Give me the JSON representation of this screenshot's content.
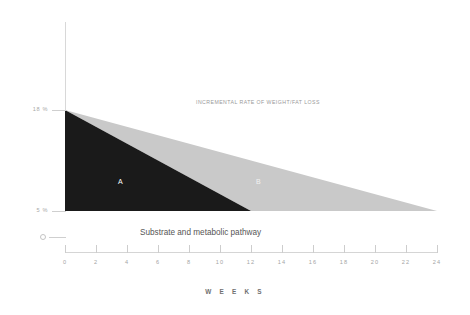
{
  "chart_data": {
    "type": "area",
    "title": "",
    "xlabel": "W E E K S",
    "ylabel": "B O D Y  F A T",
    "xlim": [
      0,
      24
    ],
    "ylim": [
      0,
      18
    ],
    "grid": false,
    "legend_position": "none",
    "x_ticks": [
      0,
      2,
      4,
      6,
      8,
      10,
      12,
      14,
      16,
      18,
      20,
      22,
      24
    ],
    "x_tick_labels": [
      "0",
      "2",
      "4",
      "6",
      "8",
      "10",
      "12",
      "14",
      "16",
      "18",
      "20",
      "22",
      "24"
    ],
    "y_ticks": [
      0,
      5,
      18
    ],
    "y_tick_labels": [
      "0",
      "5 %",
      "18 %"
    ],
    "series": [
      {
        "name": "A",
        "label": "A",
        "color": "#1a1a1a",
        "description": "Dark wedge: body fat falls from 18% at week 0 to 5% at week 12",
        "points": [
          [
            0,
            18
          ],
          [
            0,
            5
          ],
          [
            12,
            5
          ]
        ]
      },
      {
        "name": "B",
        "label": "B",
        "color": "#c9c9c9",
        "description": "Light wedge: body fat falls from 18% at week 0 to 5% at week 24",
        "points": [
          [
            0,
            18
          ],
          [
            12,
            5
          ],
          [
            24,
            5
          ]
        ]
      }
    ],
    "annotations": [
      {
        "id": "incremental-rate",
        "text": "INCREMENTAL RATE OF WEIGHT/FAT LOSS",
        "x": 8.6,
        "y": 17.2
      },
      {
        "id": "substrate-pathway",
        "text": "Substrate and metabolic pathway",
        "x": 4.9,
        "y": 2.8
      }
    ]
  },
  "axes": {
    "y_title": "B O D Y  F A T",
    "x_title": "W E E K S",
    "y_labels": {
      "upper": "18 %",
      "lower": "5 %",
      "origin": "0"
    },
    "x_labels": [
      "0",
      "2",
      "4",
      "6",
      "8",
      "10",
      "12",
      "14",
      "16",
      "18",
      "20",
      "22",
      "24"
    ]
  },
  "regions": {
    "a_label": "A",
    "b_label": "B"
  },
  "annotations": {
    "top": "INCREMENTAL RATE OF WEIGHT/FAT LOSS",
    "bottom": "Substrate and metabolic pathway"
  },
  "colors": {
    "region_a": "#1a1a1a",
    "region_b": "#c9c9c9",
    "background": "#ffffff",
    "axis": "#d5d5d5",
    "tick_text": "#a5a5a5"
  }
}
